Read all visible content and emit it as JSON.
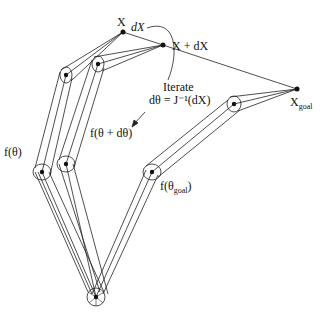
{
  "labels": {
    "x": "X",
    "dx": "dX",
    "x_plus_dx": "X + dX",
    "x_goal_main": "X",
    "x_goal_sub": "goal",
    "iterate": "Iterate",
    "iterate_formula": "dθ = J⁻¹(dX)",
    "f_theta": "f(θ)",
    "f_theta_dtheta": "f(θ + dθ)",
    "f_theta_goal_main": "f(θ",
    "f_theta_goal_sub": "goal",
    "f_theta_goal_close": ")"
  },
  "colors": {
    "stroke": "#222222",
    "background": "#ffffff"
  }
}
